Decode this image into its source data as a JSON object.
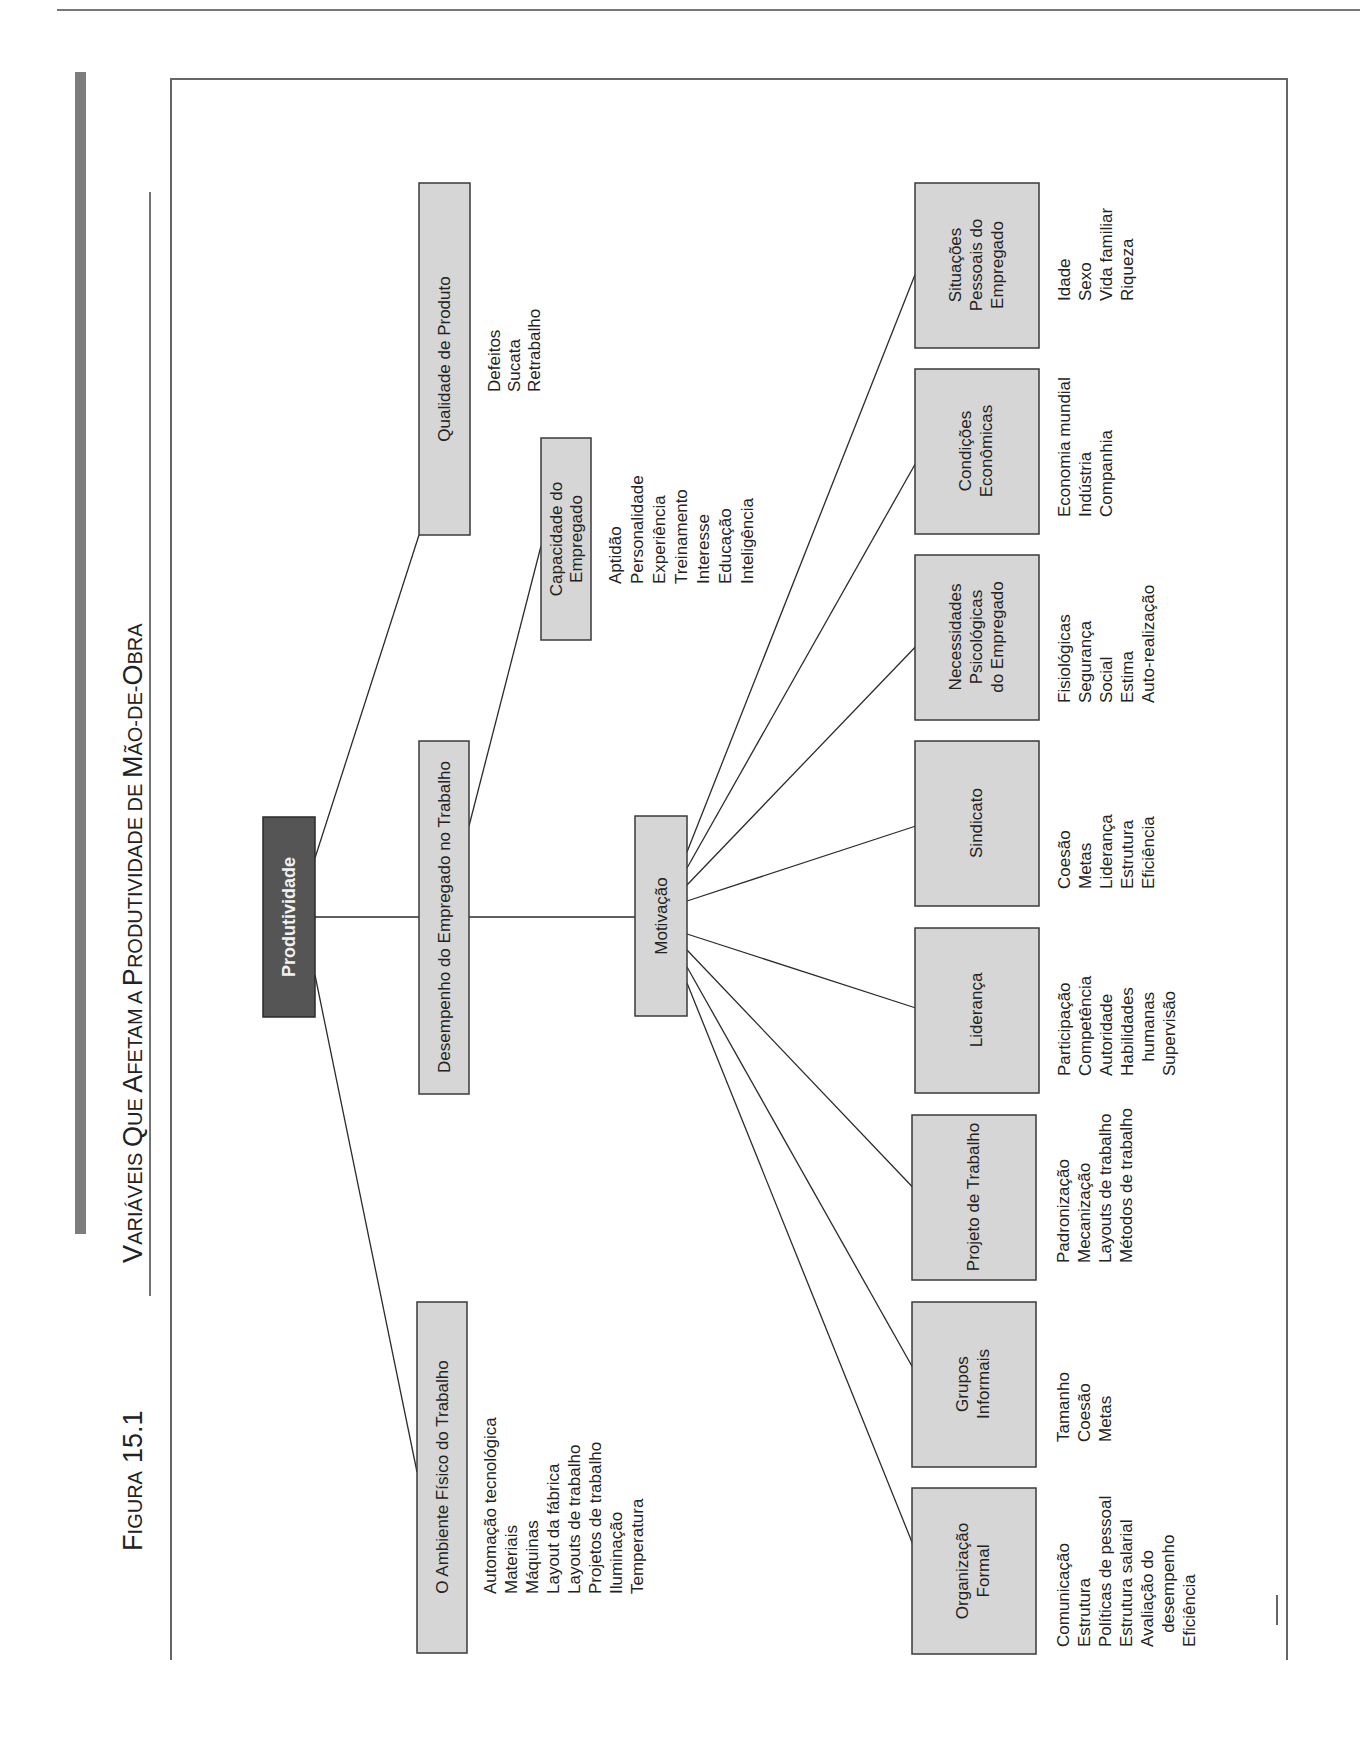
{
  "page": {
    "running_header": "Parte IV   Decisões Quanto ao Controle",
    "figure_label": {
      "initial": "F",
      "rest": "IGURA",
      "number": "15.1"
    },
    "title": {
      "parts": [
        {
          "big": "V",
          "small": "ARIÁVEIS "
        },
        {
          "big": "Q",
          "small": "UE "
        },
        {
          "big": "A",
          "small": "FETAM A "
        },
        {
          "big": "P",
          "small": "RODUTIVIDADE DE "
        },
        {
          "big": "M",
          "small": "ÃO-DE-"
        },
        {
          "big": "O",
          "small": "BRA"
        }
      ],
      "full": "Variáveis Que Afetam a Produtividade de Mão-de-Obra"
    }
  },
  "diagram": {
    "root": {
      "label": "Produtividade",
      "color": "#555555"
    },
    "level1": [
      {
        "id": "ambiente",
        "label": "O Ambiente Físico do Trabalho",
        "items": [
          "Automação tecnológica",
          "Materiais",
          "Máquinas",
          "Layout da fábrica",
          "Layouts de trabalho",
          "Projetos de trabalho",
          "Iluminação",
          "Temperatura"
        ]
      },
      {
        "id": "desempenho",
        "label": "Desempenho do Empregado no Trabalho",
        "items": []
      },
      {
        "id": "qualidade",
        "label": "Qualidade de Produto",
        "items": [
          "Defeitos",
          "Sucata",
          "Retrabalho"
        ]
      }
    ],
    "level2": [
      {
        "id": "motivacao",
        "label": "Motivação",
        "items": []
      },
      {
        "id": "capacidade",
        "label_lines": [
          "Capacidade do",
          "Empregado"
        ],
        "items": [
          "Aptidão",
          "Personalidade",
          "Experiência",
          "Treinamento",
          "Interesse",
          "Educação",
          "Inteligência"
        ]
      }
    ],
    "motivation_factors": [
      {
        "id": "organizacao",
        "label_lines": [
          "Organização",
          "Formal"
        ],
        "items": [
          "Comunicação",
          "Estrutura",
          "Políticas de pessoal",
          "Estrutura salarial",
          "Avaliação do",
          "   desempenho",
          "Eficiência"
        ]
      },
      {
        "id": "grupos",
        "label_lines": [
          "Grupos",
          "Informais"
        ],
        "items": [
          "Tamanho",
          "Coesão",
          "Metas"
        ]
      },
      {
        "id": "projeto",
        "label_lines": [
          "Projeto de Trabalho"
        ],
        "items": [
          "Padronização",
          "Mecanização",
          "Layouts de trabalho",
          "Métodos de trabalho"
        ]
      },
      {
        "id": "lideranca",
        "label_lines": [
          "Liderança"
        ],
        "items": [
          "Participação",
          "Competência",
          "Autoridade",
          "Habilidades",
          "   humanas",
          "Supervisão"
        ]
      },
      {
        "id": "sindicato",
        "label_lines": [
          "Sindicato"
        ],
        "items": [
          "Coesão",
          "Metas",
          "Liderança",
          "Estrutura",
          "Eficiência"
        ]
      },
      {
        "id": "necessidades",
        "label_lines": [
          "Necessidades",
          "Psicológicas",
          "do Empregado"
        ],
        "items": [
          "Fisiológicas",
          "Segurança",
          "Social",
          "Estima",
          "Auto-realização"
        ]
      },
      {
        "id": "condicoes",
        "label_lines": [
          "Condições",
          "Econômicas"
        ],
        "items": [
          "Economia mundial",
          "Indústria",
          "Companhia"
        ]
      },
      {
        "id": "situacoes",
        "label_lines": [
          "Situações",
          "Pessoais do",
          "Empregado"
        ],
        "items": [
          "Idade",
          "Sexo",
          "Vida familiar",
          "Riqueza"
        ]
      }
    ]
  }
}
